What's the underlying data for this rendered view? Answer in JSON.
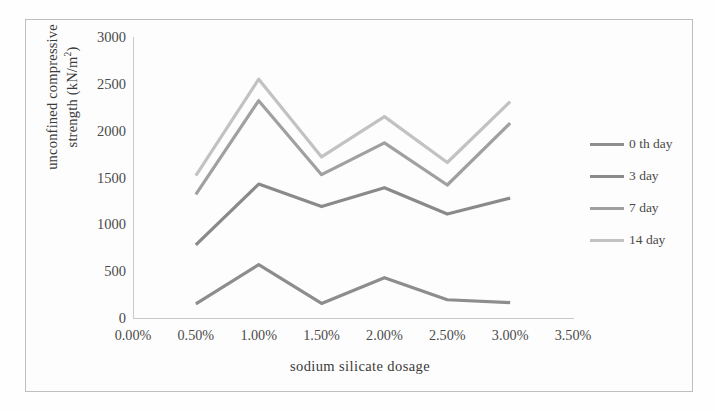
{
  "chart_data": {
    "type": "line",
    "title": "",
    "xlabel": "sodium  silicate  dosage",
    "ylabel_line1": "unconfined  compressive",
    "ylabel_line2": "strength  (kN/m",
    "ylabel_sup": "2",
    "ylabel_tail": ")",
    "x": [
      0.5,
      1.0,
      1.5,
      2.0,
      2.5,
      3.0
    ],
    "xtick_labels": [
      "0.00%",
      "0.50%",
      "1.00%",
      "1.50%",
      "2.00%",
      "2.50%",
      "3.00%",
      "3.50%"
    ],
    "xtick_values": [
      0.0,
      0.5,
      1.0,
      1.5,
      2.0,
      2.5,
      3.0,
      3.5
    ],
    "ytick_labels": [
      "0",
      "500",
      "1000",
      "1500",
      "2000",
      "2500",
      "3000"
    ],
    "ytick_values": [
      0,
      500,
      1000,
      1500,
      2000,
      2500,
      3000
    ],
    "xlim": [
      0.0,
      3.5
    ],
    "ylim": [
      0,
      3000
    ],
    "grid": false,
    "legend_position": "right",
    "series": [
      {
        "name": "0 th day",
        "color": "#8d8d8d",
        "values": [
          150,
          570,
          155,
          430,
          195,
          165
        ]
      },
      {
        "name": "3 day",
        "color": "#8a8a8a",
        "values": [
          780,
          1430,
          1190,
          1390,
          1110,
          1280
        ]
      },
      {
        "name": "7 day",
        "color": "#a0a0a0",
        "values": [
          1320,
          2320,
          1530,
          1870,
          1420,
          2080
        ]
      },
      {
        "name": "14 day",
        "color": "#c2c2c2",
        "values": [
          1520,
          2550,
          1720,
          2150,
          1660,
          2310
        ]
      }
    ]
  },
  "legend": {
    "items": [
      {
        "label": "0 th day"
      },
      {
        "label": "3 day"
      },
      {
        "label": "7 day"
      },
      {
        "label": "14 day"
      }
    ]
  }
}
